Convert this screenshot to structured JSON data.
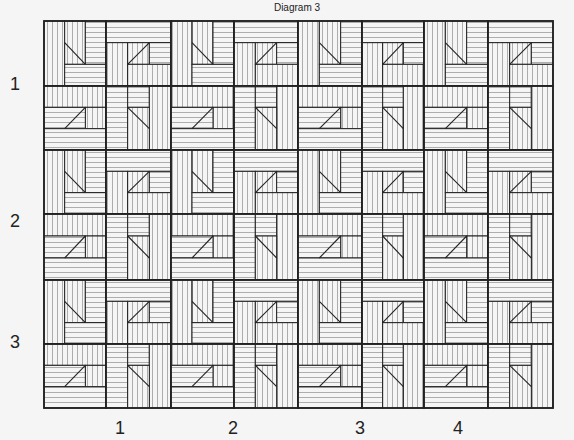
{
  "title": "Diagram 3",
  "row_labels": [
    {
      "text": "1",
      "y": 74
    },
    {
      "text": "2",
      "y": 211
    },
    {
      "text": "3",
      "y": 332
    }
  ],
  "col_labels": [
    {
      "text": "1",
      "x": 110
    },
    {
      "text": "2",
      "x": 223
    },
    {
      "text": "3",
      "x": 350
    },
    {
      "text": "4",
      "x": 448
    }
  ],
  "grid": {
    "x_edges": [
      44,
      106,
      171,
      234,
      298,
      362,
      424,
      488,
      553
    ],
    "y_edges": [
      21,
      86,
      150,
      214,
      280,
      344,
      408
    ],
    "unit_pattern": [
      [
        "A",
        "B"
      ],
      [
        "C",
        "D"
      ]
    ],
    "units_across": 4,
    "units_down": 3
  },
  "colors": {
    "background": "#f5f5f5",
    "hatch": "#9a9a9a",
    "border": "#222222"
  },
  "hatch_spacing": 5
}
